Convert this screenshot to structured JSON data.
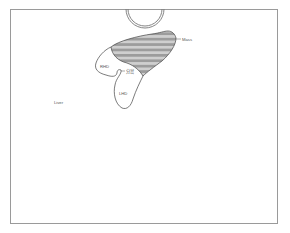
{
  "diagram": {
    "labels": {
      "mass": "Mass",
      "rhd": "RHD",
      "lhd": "LHD",
      "bifurcation": "分岔",
      "liver": "Liver"
    },
    "colors": {
      "frame": "#9a9a9a",
      "outline": "#444444",
      "mass_stripe_dark": "#9c9c9c",
      "mass_stripe_light": "#c8c8c8",
      "circle": "#777777"
    }
  }
}
